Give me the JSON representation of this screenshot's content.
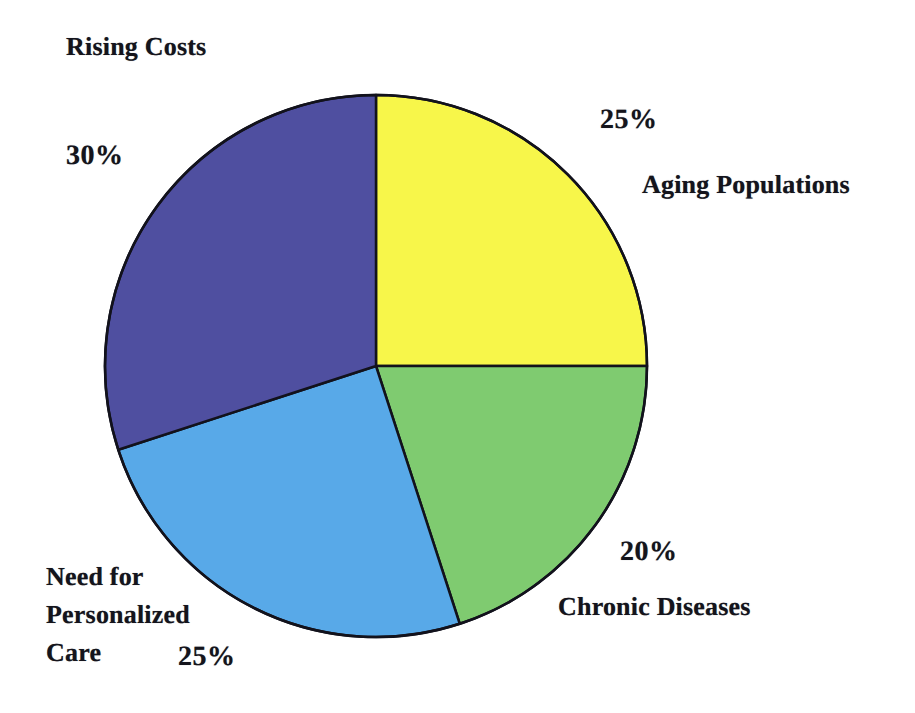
{
  "chart_data": {
    "type": "pie",
    "title": "",
    "subtitle": "",
    "xlabel": "",
    "ylabel": "",
    "legend_position": "none",
    "grid": false,
    "start_angle_deg": 0,
    "direction": "clockwise",
    "units": "percent",
    "total": 100,
    "categories": [
      "Aging Populations",
      "Chronic Diseases",
      "Need for Personalized Care",
      "Rising Costs"
    ],
    "values": [
      25,
      20,
      25,
      30
    ],
    "colors": [
      "#F7F64A",
      "#7FCB70",
      "#58A9E8",
      "#4F4FA0"
    ],
    "slices": [
      {
        "id": "aging-populations",
        "label": "Aging Populations",
        "value": 25,
        "percent_text": "25%",
        "color": "#F7F64A",
        "start_deg": 0,
        "end_deg": 90
      },
      {
        "id": "chronic-diseases",
        "label": "Chronic Diseases",
        "value": 20,
        "percent_text": "20%",
        "color": "#7FCB70",
        "start_deg": 90,
        "end_deg": 162
      },
      {
        "id": "need-for-personalized-care",
        "label": "Need for\nPersonalized\nCare",
        "label_flat": "Need for Personalized Care",
        "value": 25,
        "percent_text": "25%",
        "color": "#58A9E8",
        "start_deg": 162,
        "end_deg": 252
      },
      {
        "id": "rising-costs",
        "label": "Rising Costs",
        "value": 30,
        "percent_text": "30%",
        "color": "#4F4FA0",
        "start_deg": 252,
        "end_deg": 360
      }
    ]
  },
  "geometry": {
    "center_x": 376,
    "center_y": 366,
    "radius": 271,
    "stroke_color": "#12121c",
    "stroke_width": 2.5,
    "background": "#ffffff"
  }
}
